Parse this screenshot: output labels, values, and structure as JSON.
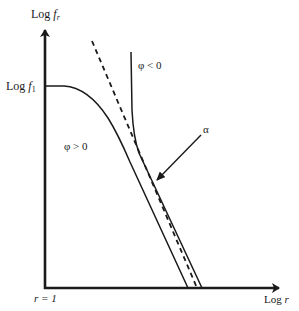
{
  "diagram": {
    "type": "log-log sketch",
    "y_axis": {
      "label_main": "Log ",
      "label_var": "f",
      "label_sub": "r"
    },
    "x_axis": {
      "label_main": "Log ",
      "label_var": "r"
    },
    "origin_label": "r = 1",
    "y_tick": {
      "label_main": "Log ",
      "label_var": "f",
      "label_sub": "1"
    },
    "curves": [
      {
        "id": "phi-positive",
        "label": "φ > 0",
        "style": "solid"
      },
      {
        "id": "phi-negative",
        "label": "φ < 0",
        "style": "solid"
      },
      {
        "id": "asymptote",
        "label": "",
        "style": "dashed"
      }
    ],
    "annotation": {
      "label": "α",
      "target": "gap between curves and asymptote"
    },
    "colors": {
      "line": "#1a1a1a",
      "background": "#ffffff"
    }
  }
}
